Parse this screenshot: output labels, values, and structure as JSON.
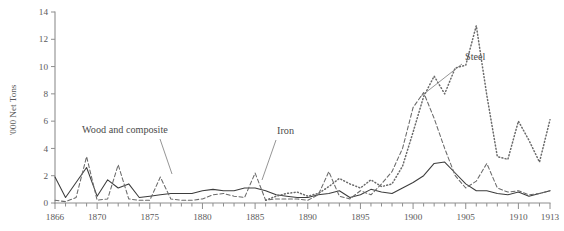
{
  "figure": {
    "background_color": "#ffffff",
    "axis_color": "#8e8e8e",
    "text_color": "#4a4a4a"
  },
  "chart_data": {
    "type": "line",
    "title": "",
    "xlabel": "",
    "ylabel": "'000 Net Tons",
    "xlim": [
      1866,
      1913
    ],
    "ylim": [
      0,
      14
    ],
    "grid": false,
    "legend_position": "inline-annotations",
    "x_tick_labels": [
      "1866",
      "1870",
      "1875",
      "1880",
      "1885",
      "1890",
      "1895",
      "1900",
      "1905",
      "1910",
      "1913"
    ],
    "x_tick_values": [
      1866,
      1870,
      1875,
      1880,
      1885,
      1890,
      1895,
      1900,
      1905,
      1910,
      1913
    ],
    "y_tick_labels": [
      "0",
      "2",
      "4",
      "6",
      "8",
      "10",
      "12",
      "14"
    ],
    "y_tick_values": [
      0,
      2,
      4,
      6,
      8,
      10,
      12,
      14
    ],
    "minor_x_tick_step": 1,
    "x": [
      1866,
      1867,
      1868,
      1869,
      1870,
      1871,
      1872,
      1873,
      1874,
      1875,
      1876,
      1877,
      1878,
      1879,
      1880,
      1881,
      1882,
      1883,
      1884,
      1885,
      1886,
      1887,
      1888,
      1889,
      1890,
      1891,
      1892,
      1893,
      1894,
      1895,
      1896,
      1897,
      1898,
      1899,
      1900,
      1901,
      1902,
      1903,
      1904,
      1905,
      1906,
      1907,
      1908,
      1909,
      1910,
      1911,
      1912,
      1913
    ],
    "series": [
      {
        "name": "Wood and composite",
        "style": "solid",
        "color": "#3c3c3c",
        "annotation_label": "Wood and composite",
        "values": [
          1.9,
          0.4,
          1.5,
          2.6,
          0.5,
          1.7,
          1.1,
          1.4,
          0.4,
          0.5,
          0.6,
          0.7,
          0.7,
          0.7,
          0.9,
          1.0,
          0.9,
          0.9,
          1.1,
          1.1,
          0.9,
          0.6,
          0.5,
          0.4,
          0.4,
          0.6,
          0.7,
          0.9,
          0.4,
          0.6,
          1.0,
          0.8,
          0.7,
          1.1,
          1.5,
          2.0,
          2.9,
          3.0,
          2.2,
          1.4,
          0.9,
          0.9,
          0.7,
          0.6,
          0.8,
          0.5,
          0.7,
          0.9
        ]
      },
      {
        "name": "Iron",
        "style": "dashed",
        "color": "#6a6a6a",
        "annotation_label": "Iron",
        "values": [
          0.2,
          0.1,
          0.4,
          3.4,
          0.2,
          0.3,
          2.8,
          0.3,
          0.2,
          0.2,
          1.9,
          0.3,
          0.2,
          0.2,
          0.3,
          0.6,
          0.7,
          0.5,
          0.4,
          2.2,
          0.2,
          0.3,
          0.3,
          0.3,
          0.2,
          0.6,
          2.3,
          0.5,
          0.3,
          0.9,
          0.6,
          1.4,
          2.3,
          4.0,
          7.0,
          8.1,
          6.2,
          4.0,
          2.0,
          1.1,
          1.6,
          2.9,
          1.1,
          0.8,
          0.9,
          0.6,
          0.7,
          0.9
        ]
      },
      {
        "name": "Steel",
        "style": "dotted",
        "color": "#6a6a6a",
        "annotation_label": "Steel",
        "start_year": 1886,
        "values": [
          null,
          null,
          null,
          null,
          null,
          null,
          null,
          null,
          null,
          null,
          null,
          null,
          null,
          null,
          null,
          null,
          null,
          null,
          null,
          null,
          0.2,
          0.5,
          0.7,
          0.8,
          0.5,
          0.7,
          1.2,
          1.8,
          1.4,
          1.1,
          1.7,
          1.2,
          1.4,
          2.7,
          5.2,
          7.8,
          9.3,
          8.0,
          9.9,
          10.1,
          13.0,
          8.0,
          3.5,
          3.4,
          5.2,
          6.1,
          3.2,
          3.0
        ]
      }
    ],
    "series_late_overrides": {
      "Steel": {
        "1903": 8.0,
        "1904": 9.9,
        "1905": 10.1,
        "1906": 13.0,
        "1907": 7.9,
        "1908": 3.4,
        "1909": 3.2,
        "1910": 6.0,
        "1911": 4.6,
        "1912": 3.0,
        "1913": 6.1
      }
    },
    "annotations": [
      {
        "label": "Wood and composite",
        "x": 82,
        "y": 133
      },
      {
        "label": "Iron",
        "x": 277,
        "y": 134
      },
      {
        "label": "Steel",
        "x": 465,
        "y": 60
      }
    ]
  }
}
